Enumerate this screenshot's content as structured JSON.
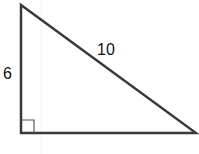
{
  "diagram": {
    "type": "right-triangle",
    "labels": {
      "vertical_leg": "6",
      "hypotenuse": "10"
    },
    "right_angle_marker": true,
    "colors": {
      "stroke": "#3a3a3a",
      "text": "#111111",
      "background": "#ffffff"
    }
  }
}
